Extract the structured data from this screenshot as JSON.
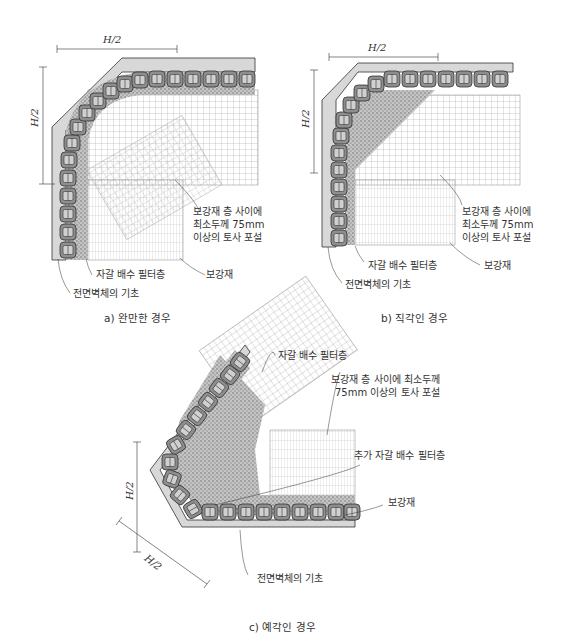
{
  "figures": [
    {
      "id": "a",
      "caption": "a) 완만한 경우",
      "dim_horizontal": "H/2",
      "dim_vertical": "H/2",
      "labels": {
        "soil_fill": [
          "보강재 층 사이에",
          "최소두께 75mm",
          "이상의 토사 포설"
        ],
        "gravel_filter": "자갈 배수 필터층",
        "reinforcement": "보강재",
        "foundation": "전면벽체의 기초"
      }
    },
    {
      "id": "b",
      "caption": "b) 직각인 경우",
      "dim_horizontal": "H/2",
      "dim_vertical": "H/2",
      "labels": {
        "soil_fill": [
          "보강재 층 사이에",
          "최소두께 75mm",
          "이상의 토사 포설"
        ],
        "gravel_filter": "자갈 배수 필터층",
        "reinforcement": "보강재",
        "foundation": "전면벽체의 기초"
      }
    },
    {
      "id": "c",
      "caption": "c) 예각인 경우",
      "dim_vertical": "H/2",
      "dim_diagonal": "H/2",
      "labels": {
        "gravel_filter": "자갈 배수 필터층",
        "soil_fill": [
          "보강재 층 사이에 최소두께",
          "75mm 이상의 토사 포설"
        ],
        "extra_filter": "추가 자갈 배수 필터층",
        "reinforcement": "보강재",
        "foundation": "전면벽체의 기초"
      }
    }
  ],
  "colors": {
    "foundation_fill": "#d8d8d8",
    "block_fill": "#9a9a9a",
    "gravel_fill": "#b8b8b8",
    "grid_line": "#888888",
    "text": "#333333"
  }
}
